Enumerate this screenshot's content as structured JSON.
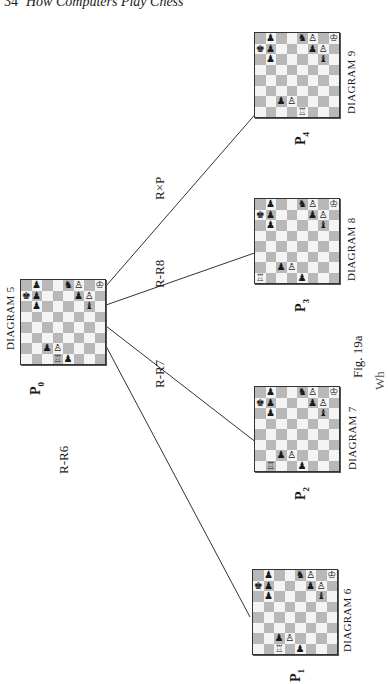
{
  "header": {
    "page_number": "34",
    "running_title": "How Computers Play Chess"
  },
  "figure": {
    "caption": "Fig. 19a",
    "caption_fragment": "Wh",
    "root": {
      "diagram_label": "DIAGRAM 5",
      "position_label": "P",
      "position_sub": "0"
    },
    "moves": [
      {
        "label": "R-R6"
      },
      {
        "label": "R-R7"
      },
      {
        "label": "R-R8"
      },
      {
        "label": "R×P"
      }
    ],
    "children": [
      {
        "diagram_label": "DIAGRAM 6",
        "position_label": "P",
        "position_sub": "1"
      },
      {
        "diagram_label": "DIAGRAM 7",
        "position_label": "P",
        "position_sub": "2"
      },
      {
        "diagram_label": "DIAGRAM 8",
        "position_label": "P",
        "position_sub": "3"
      },
      {
        "diagram_label": "DIAGRAM 9",
        "position_label": "P",
        "position_sub": "4"
      }
    ]
  },
  "boards": {
    "b0": [
      "..........",
      ""
    ],
    "pieces_legend": {
      "K": "♔",
      "k": "♚",
      "R": "♖",
      "r": "♜",
      "P": "♙",
      "p": "♟",
      "N": "♘",
      "n": "♞",
      "B": "♗",
      "b": "♝"
    }
  }
}
